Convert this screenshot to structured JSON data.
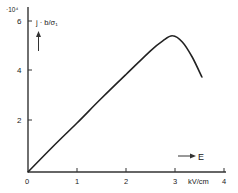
{
  "chart_data": {
    "type": "line",
    "title": "",
    "xlabel": "E",
    "x_unit": "kV/cm",
    "ylabel": "j · b/σ₁",
    "y_scale_multiplier": "·10⁴",
    "xlim": [
      0,
      4
    ],
    "ylim": [
      0,
      6.5
    ],
    "x_ticks": [
      0,
      1,
      2,
      3,
      4
    ],
    "x_tick_labels": [
      "0",
      "1",
      "2",
      "3",
      "4"
    ],
    "y_ticks": [
      2,
      4,
      6
    ],
    "y_tick_labels": [
      "2",
      "4",
      "6"
    ],
    "grid": false,
    "legend": null,
    "series": [
      {
        "name": "j · b/σ₁",
        "x": [
          0,
          0.5,
          1.0,
          1.5,
          2.0,
          2.5,
          2.75,
          2.95,
          3.15,
          3.35,
          3.55
        ],
        "y": [
          0,
          1.0,
          1.96,
          2.95,
          3.9,
          4.85,
          5.25,
          5.45,
          5.2,
          4.6,
          3.8
        ]
      }
    ]
  },
  "labels": {
    "multiplier": "·10⁴",
    "ylabel": "j · b/σ₁",
    "xlabel": "E",
    "xunit": "kV/cm",
    "x0": "0",
    "x1": "1",
    "x2": "2",
    "x3": "3",
    "x4": "4",
    "y2": "2",
    "y4": "4",
    "y6": "6"
  },
  "colors": {
    "line": "#222222",
    "axis": "#333333",
    "background": "#ffffff"
  }
}
